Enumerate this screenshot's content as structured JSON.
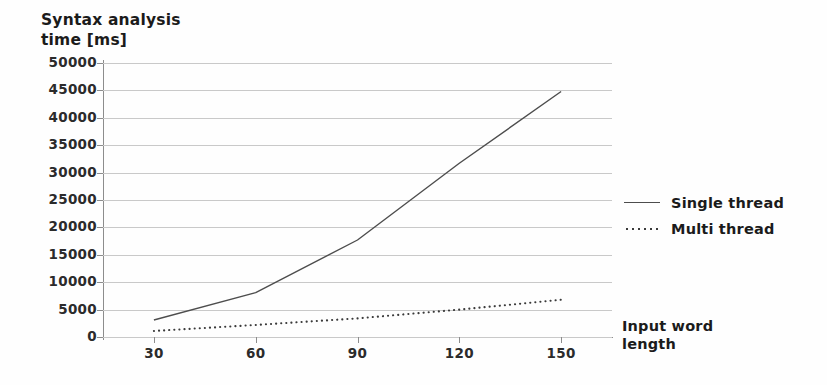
{
  "chart_data": {
    "type": "line",
    "title": "Syntax analysis time [ms]",
    "xlabel": "Input word length",
    "ylabel": "Syntax analysis time [ms]",
    "x": [
      30,
      60,
      90,
      120,
      150
    ],
    "categories": [
      "30",
      "60",
      "90",
      "120",
      "150"
    ],
    "xtick_labels": [
      "30",
      "60",
      "90",
      "120",
      "150"
    ],
    "ytick_labels": [
      "0",
      "5000",
      "10000",
      "15000",
      "20000",
      "25000",
      "30000",
      "35000",
      "40000",
      "45000",
      "50000"
    ],
    "ytick_values": [
      0,
      5000,
      10000,
      15000,
      20000,
      25000,
      30000,
      35000,
      40000,
      45000,
      50000
    ],
    "xlim": [
      15,
      165
    ],
    "ylim": [
      0,
      50000
    ],
    "grid": true,
    "legend_position": "right",
    "series": [
      {
        "name": "Single thread",
        "style": "solid",
        "color": "#4d4d4d",
        "values": [
          3100,
          8100,
          17700,
          31700,
          44800
        ]
      },
      {
        "name": "Multi thread",
        "style": "dotted",
        "color": "#3a3a3a",
        "values": [
          1100,
          2200,
          3400,
          5000,
          6800
        ]
      }
    ]
  },
  "axis": {
    "y_title_text": "Syntax analysis\ntime [ms]",
    "x_title_text": "Input word\nlength"
  },
  "legend": {
    "items": [
      {
        "label": "Single thread",
        "style": "solid"
      },
      {
        "label": "Multi thread",
        "style": "dotted"
      }
    ]
  },
  "colors": {
    "grid": "#c9c9c9",
    "axis": "#8d8d8d",
    "text": "#1b1b1b",
    "background": "#fefefe"
  }
}
